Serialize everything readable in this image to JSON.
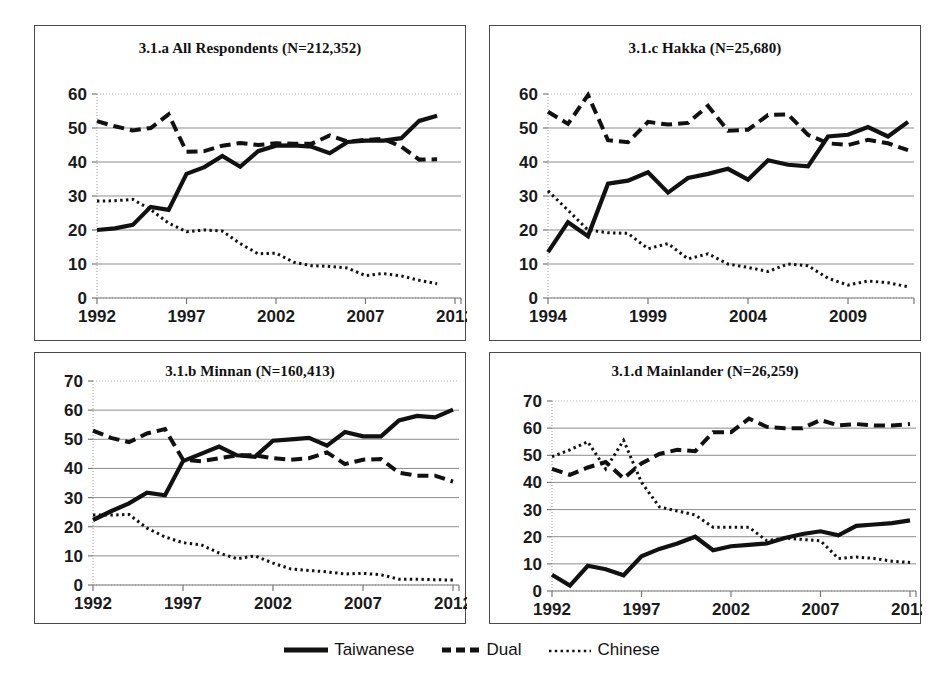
{
  "figure": {
    "legend": {
      "position": "bottom-center",
      "entries": [
        {
          "label": "Taiwanese",
          "style": "solid"
        },
        {
          "label": "Dual",
          "style": "dashed"
        },
        {
          "label": "Chinese",
          "style": "dotted"
        }
      ]
    }
  },
  "chart_data": [
    {
      "id": "panel-a",
      "type": "line",
      "title": "3.1.a All Respondents (N=212,352)",
      "xlabel": "",
      "ylabel": "",
      "xlim": [
        1992,
        2012
      ],
      "ylim": [
        0,
        60
      ],
      "ytick_step": 10,
      "yticks": [
        "0",
        "10",
        "20",
        "30",
        "40",
        "50",
        "60"
      ],
      "xticks": [
        "1992",
        "1997",
        "2002",
        "2007",
        "2012"
      ],
      "grid": true,
      "x": [
        1992,
        1993,
        1994,
        1995,
        1996,
        1997,
        1998,
        1999,
        2000,
        2001,
        2002,
        2003,
        2004,
        2005,
        2006,
        2007,
        2008,
        2009,
        2010,
        2011
      ],
      "series": [
        {
          "name": "Taiwanese",
          "values": [
            20,
            20.5,
            21.5,
            26.8,
            25.9,
            36.5,
            38.5,
            41.8,
            38.6,
            43.2,
            44.8,
            44.9,
            44.5,
            42.6,
            45.9,
            46.3,
            46.3,
            47,
            52.1,
            53.6
          ]
        },
        {
          "name": "Dual",
          "values": [
            52,
            50.5,
            49.3,
            50,
            54,
            43,
            43.2,
            44.8,
            45.6,
            45,
            45.5,
            45.4,
            45.4,
            47.8,
            46,
            46.5,
            46.8,
            44.5,
            40.7,
            40.8
          ]
        },
        {
          "name": "Chinese",
          "values": [
            28.5,
            28.6,
            29,
            26,
            22,
            19.5,
            20,
            19.7,
            16,
            13,
            13.2,
            10.5,
            9.5,
            9.3,
            8.8,
            6.6,
            7.2,
            6.5,
            5.2,
            4.2
          ]
        }
      ]
    },
    {
      "id": "panel-c",
      "type": "line",
      "title": "3.1.c Hakka (N=25,680)",
      "xlabel": "",
      "ylabel": "",
      "xlim": [
        1994,
        2012
      ],
      "ylim": [
        0,
        60
      ],
      "ytick_step": 10,
      "yticks": [
        "0",
        "10",
        "20",
        "30",
        "40",
        "50",
        "60"
      ],
      "xticks": [
        "1994",
        "1999",
        "2004",
        "2009"
      ],
      "grid": true,
      "x": [
        1994,
        1995,
        1996,
        1997,
        1998,
        1999,
        2000,
        2001,
        2002,
        2003,
        2004,
        2005,
        2006,
        2007,
        2008,
        2009,
        2010,
        2011,
        2012
      ],
      "series": [
        {
          "name": "Taiwanese",
          "values": [
            13.5,
            22.3,
            18.2,
            33.6,
            34.5,
            37,
            31,
            35.3,
            36.5,
            38,
            34.8,
            40.5,
            39.2,
            38.7,
            47.5,
            48,
            50.3,
            47.5,
            51.8
          ]
        },
        {
          "name": "Dual",
          "values": [
            54.8,
            51.2,
            59.7,
            46.4,
            45.8,
            51.8,
            51,
            51.5,
            56.5,
            49.2,
            49.5,
            53.8,
            54,
            48,
            45.5,
            45,
            46.5,
            45.5,
            43.5
          ]
        },
        {
          "name": "Chinese",
          "values": [
            31.5,
            25.8,
            20,
            19.2,
            19,
            14.5,
            16,
            11.5,
            13,
            10,
            9,
            7.8,
            10,
            9.5,
            5.8,
            3.8,
            5,
            4.5,
            3.3
          ]
        }
      ]
    },
    {
      "id": "panel-b",
      "type": "line",
      "title": "3.1.b Minnan (N=160,413)",
      "xlabel": "",
      "ylabel": "",
      "xlim": [
        1992,
        2012
      ],
      "ylim": [
        0,
        70
      ],
      "ytick_step": 10,
      "yticks": [
        "0",
        "10",
        "20",
        "30",
        "40",
        "50",
        "60",
        "70"
      ],
      "xticks": [
        "1992",
        "1997",
        "2002",
        "2007",
        "2012"
      ],
      "grid": true,
      "x": [
        1992,
        1993,
        1994,
        1995,
        1996,
        1997,
        1998,
        1999,
        2000,
        2001,
        2002,
        2003,
        2004,
        2005,
        2006,
        2007,
        2008,
        2009,
        2010,
        2011,
        2012
      ],
      "series": [
        {
          "name": "Taiwanese",
          "values": [
            22.3,
            25.3,
            28,
            31.7,
            30.8,
            42.5,
            45,
            47.5,
            44.5,
            44,
            49.5,
            50,
            50.5,
            47.8,
            52.5,
            51,
            51,
            56.5,
            58,
            57.5,
            60.2
          ]
        },
        {
          "name": "Dual",
          "values": [
            53,
            50.5,
            49,
            52,
            53.5,
            43,
            42.5,
            43.5,
            44.5,
            44.5,
            43.5,
            43,
            43.5,
            45.5,
            41.5,
            43,
            43.2,
            38.5,
            37.5,
            37.5,
            35.5
          ]
        },
        {
          "name": "Chinese",
          "values": [
            24,
            24,
            24.2,
            19.5,
            16.5,
            14.5,
            13.8,
            11,
            9,
            10,
            7.5,
            5.5,
            5,
            4.5,
            3.8,
            4,
            3.5,
            2,
            2,
            1.8,
            1.7
          ]
        }
      ]
    },
    {
      "id": "panel-d",
      "type": "line",
      "title": "3.1.d Mainlander (N=26,259)",
      "xlabel": "",
      "ylabel": "",
      "xlim": [
        1992,
        2012
      ],
      "ylim": [
        0,
        70
      ],
      "ytick_step": 10,
      "yticks": [
        "0",
        "10",
        "20",
        "30",
        "40",
        "50",
        "60",
        "70"
      ],
      "xticks": [
        "1992",
        "1997",
        "2002",
        "2007",
        "2012"
      ],
      "grid": true,
      "x": [
        1992,
        1993,
        1994,
        1995,
        1996,
        1997,
        1998,
        1999,
        2000,
        2001,
        2002,
        2003,
        2004,
        2005,
        2006,
        2007,
        2008,
        2009,
        2010,
        2011,
        2012
      ],
      "series": [
        {
          "name": "Taiwanese",
          "values": [
            6,
            2,
            9.3,
            8,
            5.8,
            12.8,
            15.5,
            17.5,
            20,
            15,
            16.5,
            17,
            17.5,
            19.5,
            21,
            22,
            20.5,
            24,
            24.5,
            25,
            26
          ]
        },
        {
          "name": "Dual",
          "values": [
            45,
            42.8,
            45.5,
            47.5,
            41.5,
            47,
            50.5,
            52,
            51.5,
            58.5,
            58.5,
            63.5,
            60.5,
            60,
            60,
            63,
            61,
            61.5,
            61,
            61,
            61.5
          ]
        },
        {
          "name": "Chinese",
          "values": [
            49.5,
            52,
            55,
            45,
            55.5,
            40,
            31,
            29.5,
            28,
            23.5,
            23.5,
            23.5,
            18.5,
            19.5,
            19,
            18.5,
            12,
            12.5,
            12,
            11,
            10.5
          ]
        }
      ]
    }
  ]
}
